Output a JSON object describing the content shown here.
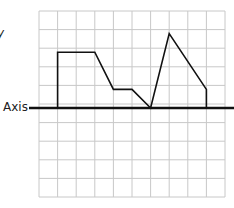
{
  "labels": {
    "axis": "Axis",
    "y_fragment": "y"
  },
  "grid": {
    "left": 39,
    "top": 11,
    "cols": 10,
    "rows": 10,
    "cell": 18.6,
    "color": "#c8c8c8"
  },
  "axis_line": {
    "y": 108,
    "x_start": 29,
    "x_end": 234,
    "color": "#111111"
  },
  "chart_data": {
    "type": "line",
    "title": "",
    "xlabel": "",
    "ylabel": "",
    "annotations": [
      "Axis"
    ],
    "grid": true,
    "units": "grid squares (x from left edge, y above the axis)",
    "x": [
      1,
      1,
      3,
      4,
      5,
      6,
      7,
      9,
      9
    ],
    "values": [
      0,
      3,
      3,
      1,
      1,
      0,
      4,
      1,
      0
    ],
    "xlim": [
      0,
      10
    ],
    "ylim": [
      -5,
      5
    ]
  }
}
